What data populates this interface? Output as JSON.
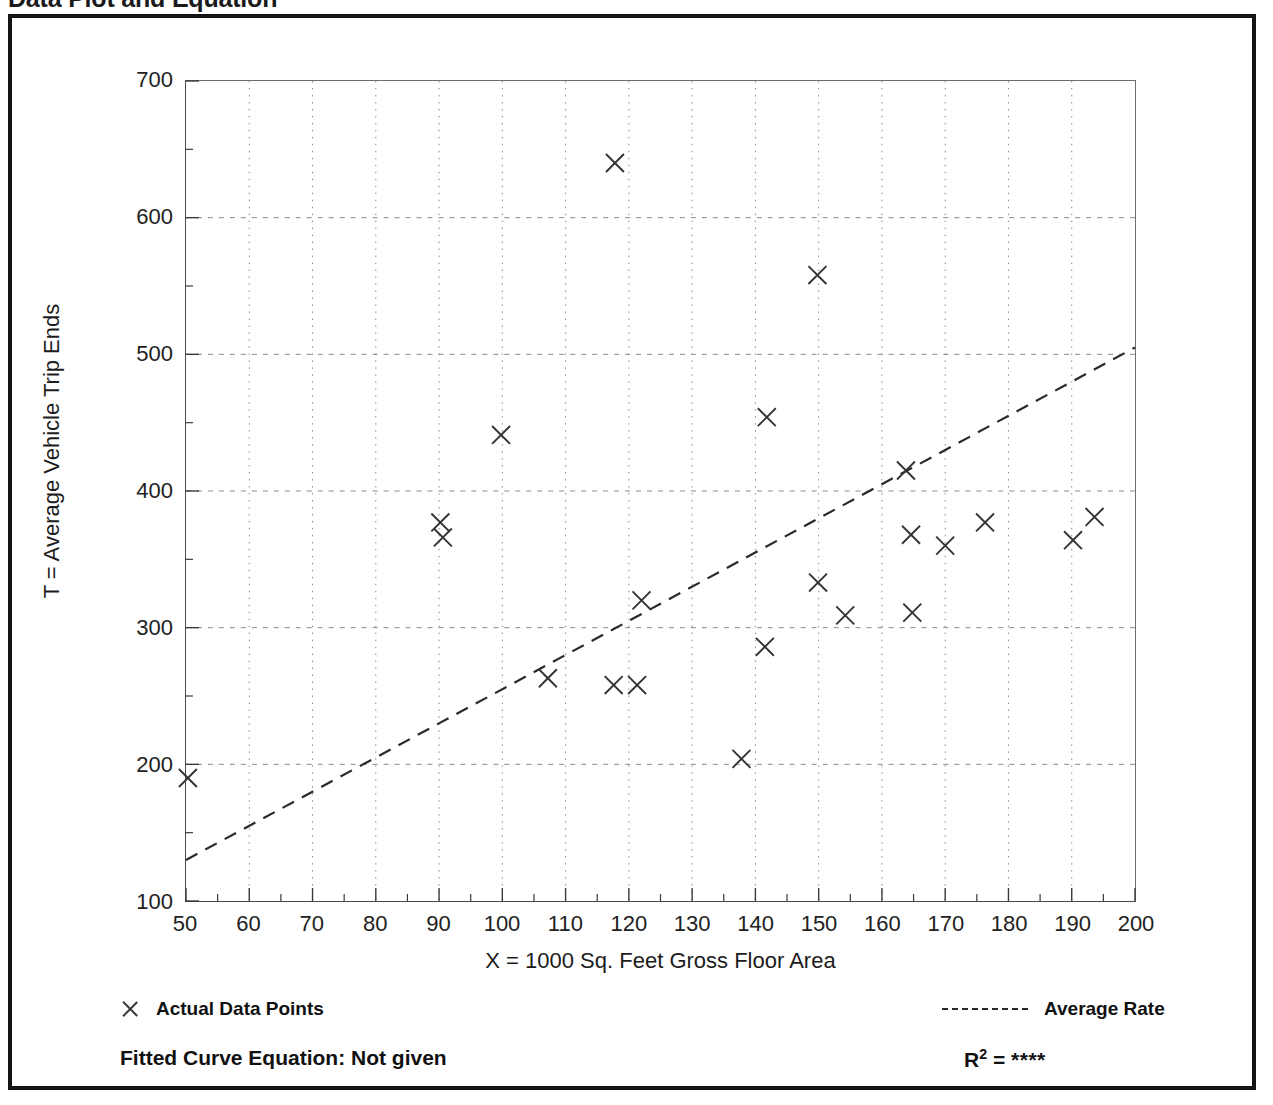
{
  "document": {
    "title": "Data Plot and Equation"
  },
  "chart_data": {
    "type": "scatter",
    "title": "Data Plot and Equation",
    "xlabel": "X = 1000 Sq. Feet Gross Floor Area",
    "ylabel": "T = Average Vehicle Trip Ends",
    "xlim": [
      50,
      200
    ],
    "ylim": [
      100,
      700
    ],
    "xticks": [
      50,
      60,
      70,
      80,
      90,
      100,
      110,
      120,
      130,
      140,
      150,
      160,
      170,
      180,
      190,
      200
    ],
    "yticks": [
      100,
      200,
      300,
      400,
      500,
      600,
      700
    ],
    "xminor_step": 5,
    "yminor_step": 50,
    "grid": true,
    "legend_position": "below-plot",
    "series": [
      {
        "name": "Actual Data Points",
        "type": "scatter",
        "marker": "x",
        "color": "#333333",
        "points": [
          [
            50.3,
            190
          ],
          [
            90.2,
            377
          ],
          [
            90.6,
            366
          ],
          [
            99.8,
            441
          ],
          [
            107.2,
            263
          ],
          [
            117.8,
            640
          ],
          [
            117.6,
            258
          ],
          [
            121.3,
            258
          ],
          [
            122.0,
            320
          ],
          [
            137.8,
            204
          ],
          [
            141.5,
            286
          ],
          [
            141.8,
            454
          ],
          [
            149.8,
            558
          ],
          [
            149.9,
            333
          ],
          [
            154.2,
            309
          ],
          [
            163.8,
            415
          ],
          [
            164.6,
            368
          ],
          [
            164.8,
            311
          ],
          [
            170.0,
            360
          ],
          [
            176.3,
            377
          ],
          [
            190.2,
            364
          ],
          [
            193.6,
            381
          ]
        ]
      },
      {
        "name": "Average Rate",
        "type": "line",
        "style": "dashed",
        "color": "#2a2a2a",
        "points": [
          [
            50,
            130
          ],
          [
            200,
            505
          ]
        ]
      }
    ],
    "annotations": {
      "fitted_curve_equation": "Fitted Curve Equation:  Not given",
      "r_squared_label": "R",
      "r_squared_exponent": "2",
      "r_squared_value": "****"
    }
  },
  "legend": {
    "data_points_label": "Actual Data Points",
    "average_rate_label": "Average Rate"
  }
}
